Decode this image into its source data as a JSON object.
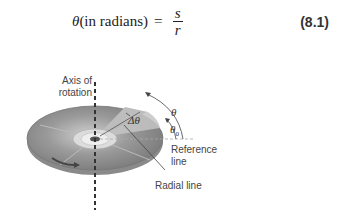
{
  "equation": {
    "theta": "θ",
    "lhs_text": "(in radians)",
    "equals": "=",
    "numerator": "s",
    "denominator": "r",
    "number": "(8.1)"
  },
  "figure": {
    "axis_label_line1": "Axis of",
    "axis_label_line2": "rotation",
    "delta_theta": "Δθ",
    "theta": "θ",
    "theta_zero": "θ",
    "theta_zero_sub": "0",
    "reference_line1": "Reference",
    "reference_line2": "line",
    "radial_line": "Radial line"
  }
}
